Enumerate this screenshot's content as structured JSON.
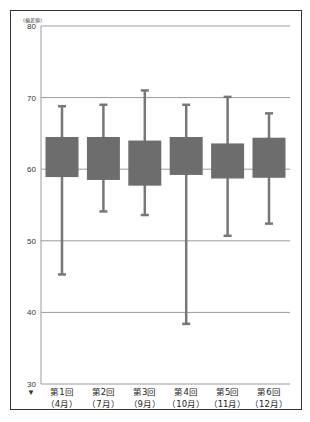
{
  "chart_data": {
    "type": "boxplot",
    "title": "",
    "ylabel": "(偏差値)",
    "xlabel": "",
    "ylim": [
      30,
      80
    ],
    "yticks": [
      30,
      40,
      50,
      60,
      70,
      80
    ],
    "grid": true,
    "legend": null,
    "categories": [
      {
        "line1": "第1回",
        "line2": "（4月）"
      },
      {
        "line1": "第2回",
        "line2": "（7月）"
      },
      {
        "line1": "第3回",
        "line2": "（9月）"
      },
      {
        "line1": "第4回",
        "line2": "（10月）"
      },
      {
        "line1": "第5回",
        "line2": "（11月）"
      },
      {
        "line1": "第6回",
        "line2": "（12月）"
      }
    ],
    "boxes": [
      {
        "min": 45.3,
        "q1": 58.9,
        "q3": 64.5,
        "max": 68.8
      },
      {
        "min": 54.1,
        "q1": 58.5,
        "q3": 64.5,
        "max": 69.0
      },
      {
        "min": 53.6,
        "q1": 57.7,
        "q3": 64.0,
        "max": 71.0
      },
      {
        "min": 38.4,
        "q1": 59.2,
        "q3": 64.5,
        "max": 69.0
      },
      {
        "min": 50.7,
        "q1": 58.7,
        "q3": 63.6,
        "max": 70.1
      },
      {
        "min": 52.4,
        "q1": 58.8,
        "q3": 64.4,
        "max": 67.8
      }
    ],
    "axis_marker": "▼"
  },
  "colors": {
    "box": "#6d6d6d",
    "whisker": "#777777",
    "grid": "#9a9a9a",
    "frame": "#333333"
  }
}
